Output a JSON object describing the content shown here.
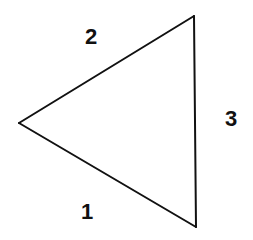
{
  "diagram": {
    "type": "triangle",
    "stroke_color": "#111111",
    "background_color": "#ffffff",
    "vertices": {
      "top": {
        "x": 194,
        "y": 16
      },
      "left": {
        "x": 19,
        "y": 123
      },
      "bottom": {
        "x": 196,
        "y": 227
      }
    },
    "edges": [
      {
        "id": "edge-1",
        "from": "left",
        "to": "bottom",
        "label": "1",
        "label_pos": {
          "x": 87,
          "y": 212
        }
      },
      {
        "id": "edge-2",
        "from": "left",
        "to": "top",
        "label": "2",
        "label_pos": {
          "x": 91,
          "y": 37
        }
      },
      {
        "id": "edge-3",
        "from": "top",
        "to": "bottom",
        "label": "3",
        "label_pos": {
          "x": 231,
          "y": 119
        }
      }
    ]
  }
}
